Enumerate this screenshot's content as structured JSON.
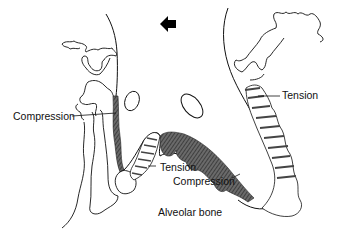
{
  "diagram": {
    "direction_arrow": {
      "icon": "arrow-left-icon",
      "color": "#000000"
    },
    "labels": {
      "compression_left": "Compression",
      "tension_right": "Tension",
      "tension_bottom": "Tension",
      "compression_bottom": "Compression",
      "alveolar_bone": "Alveolar bone"
    },
    "colors": {
      "line": "#111111",
      "compression_fill": "#555555",
      "tension_stripe": "#444444",
      "background": "#ffffff"
    }
  }
}
